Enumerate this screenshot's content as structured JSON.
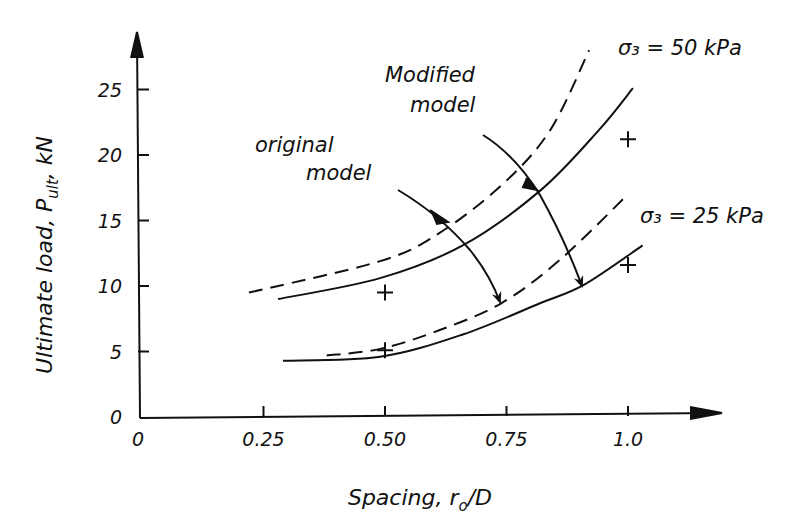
{
  "chart_data": {
    "type": "line",
    "title": "",
    "xlabel": "Spacing, r₀/D",
    "ylabel": "Ultimate load, P_ult, kN",
    "xlim": [
      0,
      1.2
    ],
    "ylim": [
      0,
      28
    ],
    "grid": false,
    "x_ticks": [
      {
        "value": 0,
        "label": "0"
      },
      {
        "value": 0.25,
        "label": "0.25"
      },
      {
        "value": 0.5,
        "label": "0.50"
      },
      {
        "value": 0.75,
        "label": "0.75"
      },
      {
        "value": 1.0,
        "label": "1.0"
      }
    ],
    "y_ticks": [
      {
        "value": 0,
        "label": "0"
      },
      {
        "value": 5,
        "label": "5"
      },
      {
        "value": 10,
        "label": "10"
      },
      {
        "value": 15,
        "label": "15"
      },
      {
        "value": 20,
        "label": "20"
      },
      {
        "value": 25,
        "label": "25"
      }
    ],
    "series": [
      {
        "name": "Original model, σ₃ = 50 kPa",
        "style": "dashed",
        "x": [
          0.22,
          0.49,
          0.61,
          0.74,
          0.84,
          0.92
        ],
        "y": [
          9.5,
          11.9,
          14.0,
          17.7,
          21.9,
          28.0
        ]
      },
      {
        "name": "Modified model, σ₃ = 50 kPa",
        "style": "solid",
        "x": [
          0.28,
          0.49,
          0.66,
          0.82,
          0.94,
          1.01
        ],
        "y": [
          9.0,
          10.6,
          13.1,
          17.3,
          21.9,
          25.1
        ]
      },
      {
        "name": "Original model, σ₃ = 25 kPa",
        "style": "dashed",
        "x": [
          0.38,
          0.49,
          0.61,
          0.74,
          0.86,
          1.0
        ],
        "y": [
          4.7,
          5.2,
          6.6,
          8.7,
          12.0,
          17.0
        ]
      },
      {
        "name": "Modified model, σ₃ = 25 kPa",
        "style": "solid",
        "x": [
          0.29,
          0.49,
          0.66,
          0.82,
          0.91,
          1.03
        ],
        "y": [
          4.3,
          4.6,
          6.3,
          8.7,
          10.1,
          13.1
        ]
      },
      {
        "name": "Measured",
        "style": "markers-plus",
        "x": [
          0.5,
          0.5,
          1.0,
          1.0
        ],
        "y": [
          9.5,
          5.1,
          21.2,
          11.6
        ]
      }
    ],
    "annotations": [
      {
        "text": "σ₃ = 50 kPa",
        "target": "upper curve pair"
      },
      {
        "text": "σ₃ = 25 kPa",
        "target": "lower curve pair"
      },
      {
        "text": "Modified model",
        "target": "solid curves (arrow)"
      },
      {
        "text": "Original model",
        "target": "dashed curves (arrow)"
      }
    ]
  },
  "labels": {
    "ylabel_main": "Ultimate load, P",
    "ylabel_sub": "ult",
    "ylabel_unit": ", kN",
    "xlabel_main": "Spacing, r",
    "xlabel_sub": "o",
    "xlabel_tail": "/D",
    "sigma50": "σ₃ = 50 kPa",
    "sigma25": "σ₃ = 25 kPa",
    "modified_line1": "Modified",
    "modified_line2": "model",
    "original_line1": "original",
    "original_line2": "model"
  }
}
